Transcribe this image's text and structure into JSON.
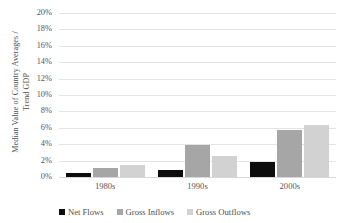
{
  "chart_data": {
    "type": "bar",
    "title": "",
    "xlabel": "",
    "ylabel": "Median Value of Country Averages / Trend GDP",
    "ylabel_lines": [
      "Median Value of Country Averages /",
      "Trend GDP"
    ],
    "categories": [
      "1980s",
      "1990s",
      "2000s"
    ],
    "series": [
      {
        "name": "Net Flows",
        "color": "#0d0d0d",
        "values": [
          0.5,
          0.9,
          1.8
        ]
      },
      {
        "name": "Gross Inflows",
        "color": "#a6a6a6",
        "values": [
          1.1,
          3.9,
          5.7
        ]
      },
      {
        "name": "Gross Outflows",
        "color": "#d2d2d2",
        "values": [
          1.5,
          2.6,
          6.3
        ]
      }
    ],
    "ylim": [
      0,
      20
    ],
    "ytick_step": 2,
    "ytick_labels": [
      "20%",
      "18%",
      "16%",
      "14%",
      "12%",
      "10%",
      "8%",
      "6%",
      "4%",
      "2%",
      "0%"
    ],
    "ytick_values": [
      20,
      18,
      16,
      14,
      12,
      10,
      8,
      6,
      4,
      2,
      0
    ],
    "grid": true,
    "legend_position": "bottom-left",
    "value_unit": "percent"
  },
  "legend": {
    "items": [
      {
        "label": "Net Flows",
        "color": "#0d0d0d"
      },
      {
        "label": "Gross Inflows",
        "color": "#a6a6a6"
      },
      {
        "label": "Gross Outflows",
        "color": "#d2d2d2"
      }
    ]
  },
  "colors": {
    "net_flows": "#0d0d0d",
    "gross_inflows": "#a6a6a6",
    "gross_outflows": "#d2d2d2",
    "gridline": "#e3e3e3",
    "text": "#565656",
    "background": "#ffffff"
  }
}
